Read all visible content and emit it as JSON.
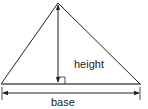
{
  "diagram": {
    "type": "triangle-area",
    "labels": {
      "height": "height",
      "base": "base"
    },
    "colors": {
      "stroke": "#222222",
      "background": "#ffffff"
    }
  }
}
